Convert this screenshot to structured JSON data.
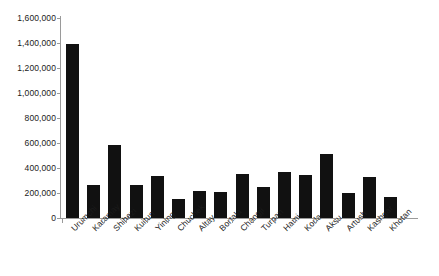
{
  "chart_data": {
    "type": "bar",
    "title": "",
    "subtitle": "",
    "xlabel": "",
    "ylabel": "",
    "ylim": [
      0,
      1600000
    ],
    "grid": false,
    "legend": "none",
    "bar_color": "#111111",
    "axis_color": "#9a9a9a",
    "background": "#ffffff",
    "y_ticks": [
      "0",
      "200,000",
      "400,000",
      "600,000",
      "800,000",
      "1,000,000",
      "1,200,000",
      "1,400,000",
      "1,600,000"
    ],
    "y_tick_values": [
      0,
      200000,
      400000,
      600000,
      800000,
      1000000,
      1200000,
      1400000,
      1600000
    ],
    "categories": [
      "Urumchi",
      "Karamay",
      "Shihezi",
      "Kuitun",
      "Yining",
      "Chuchek",
      "Altay",
      "Bortala",
      "Changji",
      "Turpan",
      "Hami",
      "Korla",
      "Aksu",
      "Artush",
      "Kashgar",
      "Khotan"
    ],
    "values": [
      1390000,
      265000,
      585000,
      268000,
      335000,
      155000,
      218000,
      212000,
      350000,
      252000,
      368000,
      345000,
      515000,
      203000,
      330000,
      172000
    ]
  }
}
